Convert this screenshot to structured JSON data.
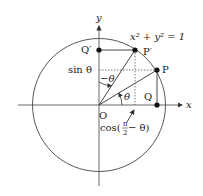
{
  "diagram": {
    "type": "unit-circle",
    "equation": "x² + y² = 1",
    "axes": {
      "x_label": "x",
      "y_label": "y"
    },
    "points": {
      "O": "O",
      "P": "P",
      "P_prime": "P′",
      "Q": "Q",
      "Q_prime": "Q′"
    },
    "labels": {
      "sin": "sin θ",
      "cos": "cos(",
      "cos_frac_num": "π",
      "cos_frac_den": "2",
      "cos_tail": " − θ)",
      "theta": "θ",
      "neg_theta": "−θ"
    },
    "colors": {
      "stroke": "#333333",
      "dotted": "#555555",
      "text": "#222222"
    }
  }
}
